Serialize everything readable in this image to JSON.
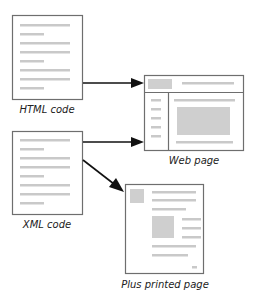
{
  "nodes": {
    "html_code": {
      "label": "HTML code"
    },
    "xml_code": {
      "label": "XML code"
    },
    "web_page": {
      "label": "Web page"
    },
    "printed_page": {
      "label": "Plus printed page"
    }
  },
  "edges": [
    {
      "from": "HTML code",
      "to": "Web page"
    },
    {
      "from": "XML code",
      "to": "Web page"
    },
    {
      "from": "XML code",
      "to": "Plus printed page"
    }
  ]
}
